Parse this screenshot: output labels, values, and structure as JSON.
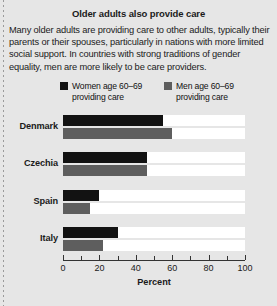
{
  "figure": {
    "title": "Older adults also provide care",
    "body": "Many older adults are providing care to other adults, typically their parents or their spouses, particularly in nations with more limited social support. In countries with strong traditions of gender equality, men are more likely to be care providers."
  },
  "colors": {
    "panel_background": "#e6e6e6",
    "track": "#ffffff",
    "women_bar": "#121212",
    "men_bar": "#5e5e5e",
    "axis": "#333333",
    "text": "#1b1b1b"
  },
  "chart_data": {
    "type": "bar",
    "orientation": "horizontal",
    "title": "Older adults also provide care",
    "xlabel": "Percent",
    "ylabel": "",
    "xlim": [
      0,
      100
    ],
    "xticks": [
      0,
      10,
      20,
      30,
      40,
      50,
      60,
      70,
      80,
      90,
      100
    ],
    "xtick_labels": [
      "0",
      "",
      "20",
      "",
      "40",
      "",
      "60",
      "",
      "80",
      "",
      "100"
    ],
    "grid": false,
    "legend_position": "top",
    "categories": [
      "Denmark",
      "Czechia",
      "Spain",
      "Italy"
    ],
    "series": [
      {
        "name": "Women age 60–69\nproviding care",
        "legend_label": "Women age 60–69\nproviding care",
        "color": "#121212",
        "values": [
          55,
          46,
          20,
          30
        ]
      },
      {
        "name": "Men age 60–69\nproviding care",
        "legend_label": "Men age 60–69\nproviding care",
        "color": "#5e5e5e",
        "values": [
          60,
          46,
          15,
          22
        ]
      }
    ]
  }
}
